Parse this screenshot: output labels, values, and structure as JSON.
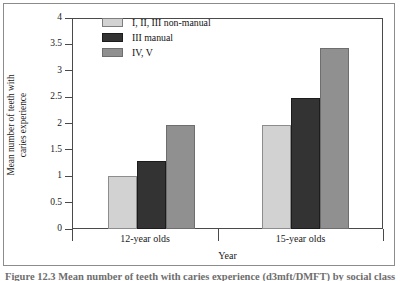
{
  "figure": {
    "caption": "Figure 12.3  Mean number of teeth with caries experience (d3mft/DMFT) by social class (1993)"
  },
  "chart_data": {
    "type": "bar",
    "title": "",
    "xlabel": "Year",
    "ylabel": "Mean number of teeth with caries experience",
    "ylabel_lines": [
      "Mean number of teeth with",
      "caries experience"
    ],
    "categories": [
      "12-year olds",
      "15-year olds"
    ],
    "series": [
      {
        "name": "I, II, III non-manual",
        "color": "#d2d2d2",
        "values": [
          1.0,
          1.97
        ]
      },
      {
        "name": "III manual",
        "color": "#333333",
        "values": [
          1.28,
          2.49
        ]
      },
      {
        "name": "IV, V",
        "color": "#909090",
        "values": [
          1.98,
          3.43
        ]
      }
    ],
    "ylim": [
      0,
      4
    ],
    "yticks": [
      "0",
      "0.5",
      "1",
      "1.5",
      "2",
      "2.5",
      "3",
      "3.5",
      "4"
    ],
    "ytick_values": [
      0,
      0.5,
      1,
      1.5,
      2,
      2.5,
      3,
      3.5,
      4
    ],
    "grid": false,
    "legend_position": "upper left"
  }
}
